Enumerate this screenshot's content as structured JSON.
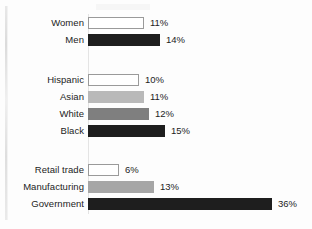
{
  "chart_data": {
    "type": "bar",
    "orientation": "horizontal",
    "title": "",
    "subtitle": "",
    "xlabel": "",
    "ylabel": "",
    "xlim": [
      0,
      36
    ],
    "grid": false,
    "legend": "none",
    "value_suffix": "%",
    "groups": [
      {
        "name": "gender",
        "categories": [
          "Women",
          "Men"
        ],
        "values": [
          11,
          14
        ],
        "value_labels": [
          "11%",
          "14%"
        ],
        "fills": [
          "white",
          "dark"
        ]
      },
      {
        "name": "race-ethnicity",
        "categories": [
          "Hispanic",
          "Asian",
          "White",
          "Black"
        ],
        "values": [
          10,
          11,
          12,
          15
        ],
        "value_labels": [
          "10%",
          "11%",
          "12%",
          "15%"
        ],
        "fills": [
          "white",
          "light",
          "mid",
          "dark"
        ]
      },
      {
        "name": "industry",
        "categories": [
          "Retail trade",
          "Manufacturing",
          "Government"
        ],
        "values": [
          6,
          13,
          36
        ],
        "value_labels": [
          "6%",
          "13%",
          "36%"
        ],
        "fills": [
          "white",
          "midlight",
          "dark"
        ]
      }
    ],
    "categories": [
      "Women",
      "Men",
      "Hispanic",
      "Asian",
      "White",
      "Black",
      "Retail trade",
      "Manufacturing",
      "Government"
    ],
    "values": [
      11,
      14,
      10,
      11,
      12,
      15,
      6,
      13,
      36
    ],
    "colors": {
      "white": "#ffffff",
      "light": "#b9b9b9",
      "midlight": "#a6a6a6",
      "mid": "#7f7f7f",
      "dark": "#1e1e1e",
      "outline": "#9a9a9a",
      "text": "#232323",
      "background": "#fdfdfd"
    }
  },
  "rows": [
    {
      "label": "Women",
      "value_label": "11%",
      "value": 11,
      "fill": "white",
      "top": 17,
      "width": 56,
      "value_x": 150
    },
    {
      "label": "Men",
      "value_label": "14%",
      "value": 14,
      "fill": "dark",
      "top": 34,
      "width": 72,
      "value_x": 166
    },
    {
      "label": "Hispanic",
      "value_label": "10%",
      "value": 10,
      "fill": "white",
      "top": 74,
      "width": 51,
      "value_x": 145
    },
    {
      "label": "Asian",
      "value_label": "11%",
      "value": 11,
      "fill": "light",
      "top": 91,
      "width": 56,
      "value_x": 150
    },
    {
      "label": "White",
      "value_label": "12%",
      "value": 12,
      "fill": "mid",
      "top": 108,
      "width": 61,
      "value_x": 155
    },
    {
      "label": "Black",
      "value_label": "15%",
      "value": 15,
      "fill": "dark",
      "top": 125,
      "width": 77,
      "value_x": 171
    },
    {
      "label": "Retail trade",
      "value_label": "6%",
      "value": 6,
      "fill": "white",
      "top": 164,
      "width": 31,
      "value_x": 125
    },
    {
      "label": "Manufacturing",
      "value_label": "13%",
      "value": 13,
      "fill": "midlight",
      "top": 181,
      "width": 66,
      "value_x": 160
    },
    {
      "label": "Government",
      "value_label": "36%",
      "value": 36,
      "fill": "dark",
      "top": 198,
      "width": 184,
      "value_x": 278
    }
  ]
}
